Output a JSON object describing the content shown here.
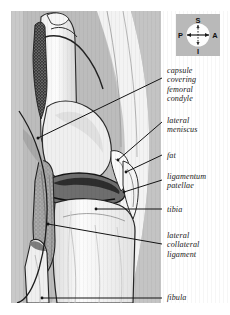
{
  "figure": {
    "kind": "anatomical-illustration",
    "rendering": "greyscale line drawing with stipple shading"
  },
  "compass": {
    "name": "orientation-compass",
    "superior": "S",
    "inferior": "I",
    "posterior": "P",
    "anterior": "A"
  },
  "labels": [
    {
      "id": "capsule",
      "text": "capsule\ncovering\nfemoral\ncondyle"
    },
    {
      "id": "meniscus",
      "text": "lateral\nmeniscus"
    },
    {
      "id": "fat",
      "text": "fat"
    },
    {
      "id": "ligpat",
      "text": "ligamentum\npatellae"
    },
    {
      "id": "tibia",
      "text": "tibia"
    },
    {
      "id": "lcl",
      "text": "lateral\ncollateral\nligament"
    },
    {
      "id": "fibula",
      "text": "fibula"
    }
  ],
  "colors": {
    "plate_background": "#c9c9c9",
    "compass_background": "#b9b9b9",
    "page_background": "#ffffff",
    "ink": "#1a1a1a",
    "bone_light": "#fbfbfb",
    "soft_tissue_mid": "#b0b0b0",
    "shadow_dark": "#4a4a4a"
  }
}
